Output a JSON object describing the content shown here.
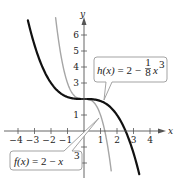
{
  "chart_data": {
    "type": "line",
    "title": "",
    "xlabel": "x",
    "ylabel": "y",
    "xlim": [
      -4.5,
      5
    ],
    "ylim": [
      -2.9,
      7
    ],
    "grid": false,
    "x_ticks": [
      -4,
      -3,
      -2,
      -1,
      1,
      2,
      3,
      4
    ],
    "x_tick_labels": [
      "−4",
      "−3",
      "−2",
      "−1",
      "1",
      "2",
      "3",
      "4"
    ],
    "y_ticks": [
      -2,
      -1,
      1,
      2,
      3,
      4,
      5,
      6
    ],
    "y_tick_labels": [
      "",
      "",
      "1",
      "",
      "3",
      "4",
      "5",
      "6"
    ],
    "series": [
      {
        "name": "f(x) = 2 − x³",
        "expression": "2 - x^3",
        "color": "#a6a6a6",
        "x_range": [
          -1.72,
          1.65
        ],
        "points": [
          [
            -1.7,
            6.91
          ],
          [
            -1.5,
            5.38
          ],
          [
            -1,
            3
          ],
          [
            -0.5,
            2.13
          ],
          [
            0,
            2
          ],
          [
            0.5,
            1.88
          ],
          [
            1,
            1
          ],
          [
            1.5,
            -1.38
          ],
          [
            1.65,
            -2.49
          ]
        ]
      },
      {
        "name": "h(x) = 2 − (1/8)x³",
        "expression": "2 - x^3/8",
        "color": "#111111",
        "x_range": [
          -3.4,
          3.35
        ],
        "points": [
          [
            -3.4,
            6.91
          ],
          [
            -3,
            5.38
          ],
          [
            -2,
            3
          ],
          [
            -1,
            2.13
          ],
          [
            0,
            2
          ],
          [
            1,
            1.88
          ],
          [
            2,
            1
          ],
          [
            3,
            -1.38
          ],
          [
            3.35,
            -2.7
          ]
        ]
      }
    ],
    "annotations": [
      {
        "text": "h(x) = 2 − (1/8)x³",
        "points_to": [
          1.2,
          1.8
        ]
      },
      {
        "text": "f(x) = 2 − x³",
        "points_to": [
          0.9,
          0.8
        ]
      }
    ]
  },
  "labels": {
    "x_axis": "x",
    "y_axis": "y",
    "h_label": {
      "lhs": "h(x)",
      "mid": " = 2 − ",
      "num": "1",
      "den": "8",
      "var": "x",
      "exp": "3"
    },
    "f_label": {
      "lhs": "f(x)",
      "mid": " = 2 − ",
      "var": "x",
      "exp": "3"
    }
  }
}
